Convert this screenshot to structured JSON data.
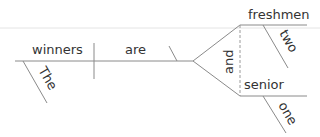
{
  "diagram": {
    "type": "sentence-diagram (Reed-Kellogg)",
    "sentence_words": [
      "The",
      "winners",
      "are",
      "two",
      "freshmen",
      "and",
      "one",
      "senior"
    ],
    "subject": {
      "word": "winners",
      "modifier": "The"
    },
    "verb": {
      "word": "are"
    },
    "conjunction": "and",
    "complements": [
      {
        "word": "freshmen",
        "modifier": "two"
      },
      {
        "word": "senior",
        "modifier": "one"
      }
    ],
    "colors": {
      "line": "#8a8a8a",
      "text": "#333333",
      "background": "#ffffff"
    }
  }
}
